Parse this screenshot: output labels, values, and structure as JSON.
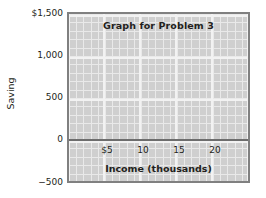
{
  "chart_data": {
    "type": "scatter",
    "title": "Graph for Problem 3",
    "xlabel": "Income (thousands)",
    "ylabel": "Saving",
    "grid": true,
    "legend": false,
    "series": [],
    "x": [],
    "values": [],
    "xlim": [
      0,
      22.5
    ],
    "ylim": [
      -500,
      1500
    ],
    "xticks": [
      5,
      10,
      15,
      20
    ],
    "yticks": [
      -500,
      0,
      500,
      1000,
      1500
    ],
    "xtick_labels": [
      "$5",
      "10",
      "15",
      "20"
    ],
    "ytick_labels": [
      "−500",
      "0",
      "500",
      "1,000",
      "$1,500"
    ],
    "note": "Blank grid graph; no data plotted",
    "colors": {
      "plot_background": "#cfcfcf",
      "grid_line": "#ffffff",
      "axis_border": "#808080",
      "zero_line": "#6d6d6d",
      "text": "#231f20",
      "page_background": "#ffffff"
    }
  },
  "y_ticks": [
    {
      "label": "$1,500",
      "top": 13
    },
    {
      "label": "1,000",
      "top": 55
    },
    {
      "label": "500",
      "top": 97
    },
    {
      "label": "0",
      "top": 139
    },
    {
      "label": "−500",
      "top": 182
    }
  ],
  "x_ticks": [
    {
      "label": "$5",
      "left": 38
    },
    {
      "label": "10",
      "left": 74
    },
    {
      "label": "15",
      "left": 110
    },
    {
      "label": "20",
      "left": 146
    }
  ]
}
